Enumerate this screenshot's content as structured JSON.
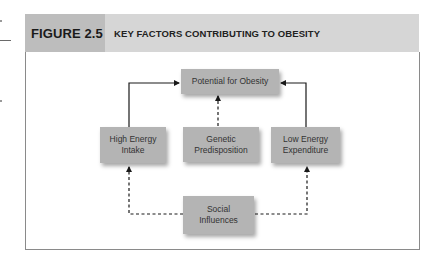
{
  "figure": {
    "label": "FIGURE 2.5",
    "title": "KEY FACTORS CONTRIBUTING TO OBESITY",
    "colors": {
      "header_bg": "#d6d6d6",
      "label_bg": "#bdbdbd",
      "node_bg": "#b4b4b4",
      "border": "#8a8a8a",
      "line": "#1a1a1a"
    }
  },
  "diagram": {
    "nodes": {
      "potential": {
        "label": "Potential for Obesity"
      },
      "high_energy": {
        "label_line1": "High Energy",
        "label_line2": "Intake"
      },
      "genetic": {
        "label_line1": "Genetic",
        "label_line2": "Predisposition"
      },
      "low_energy": {
        "label_line1": "Low Energy",
        "label_line2": "Expenditure"
      },
      "social": {
        "label_line1": "Social",
        "label_line2": "Influences"
      }
    },
    "edges": [
      {
        "from": "High Energy Intake",
        "to": "Potential for Obesity",
        "style": "solid"
      },
      {
        "from": "Low Energy Expenditure",
        "to": "Potential for Obesity",
        "style": "solid"
      },
      {
        "from": "Genetic Predisposition",
        "to": "Potential for Obesity",
        "style": "dashed"
      },
      {
        "from": "Social Influences",
        "to": "High Energy Intake",
        "style": "dashed"
      },
      {
        "from": "Social Influences",
        "to": "Low Energy Expenditure",
        "style": "dashed"
      }
    ]
  }
}
